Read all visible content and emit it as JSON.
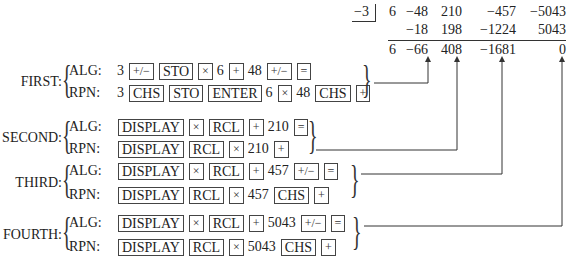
{
  "synthetic_division": {
    "divisor": "−3",
    "rows": [
      [
        "6",
        "−48",
        "210",
        "−457",
        "−5043"
      ],
      [
        "",
        "−18",
        "198",
        "−1224",
        "5043"
      ],
      [
        "6",
        "−66",
        "408",
        "−1681",
        "0"
      ]
    ]
  },
  "steps": [
    {
      "name": "FIRST:",
      "alg": {
        "label": "ALG:",
        "tokens": [
          {
            "t": "3",
            "k": false
          },
          {
            "t": "+/−",
            "k": true,
            "sm": true
          },
          {
            "t": "STO",
            "k": true
          },
          {
            "t": "×",
            "k": true,
            "sm": true
          },
          {
            "t": "6",
            "k": false
          },
          {
            "t": "+",
            "k": true,
            "sm": true
          },
          {
            "t": "48",
            "k": false
          },
          {
            "t": "+/−",
            "k": true,
            "sm": true
          },
          {
            "t": "=",
            "k": true,
            "sm": true
          }
        ]
      },
      "rpn": {
        "label": "RPN:",
        "tokens": [
          {
            "t": "3",
            "k": false
          },
          {
            "t": "CHS",
            "k": true
          },
          {
            "t": "STO",
            "k": true
          },
          {
            "t": "ENTER",
            "k": true
          },
          {
            "t": "6",
            "k": false
          },
          {
            "t": "×",
            "k": true,
            "sm": true
          },
          {
            "t": "48",
            "k": false
          },
          {
            "t": "CHS",
            "k": true
          },
          {
            "t": "+",
            "k": true,
            "sm": true
          }
        ]
      }
    },
    {
      "name": "SECOND:",
      "alg": {
        "label": "ALG:",
        "tokens": [
          {
            "t": "DISPLAY",
            "k": true
          },
          {
            "t": "×",
            "k": true,
            "sm": true
          },
          {
            "t": "RCL",
            "k": true
          },
          {
            "t": "+",
            "k": true,
            "sm": true
          },
          {
            "t": "210",
            "k": false
          },
          {
            "t": "=",
            "k": true,
            "sm": true
          }
        ]
      },
      "rpn": {
        "label": "RPN:",
        "tokens": [
          {
            "t": "DISPLAY",
            "k": true
          },
          {
            "t": "RCL",
            "k": true
          },
          {
            "t": "×",
            "k": true,
            "sm": true
          },
          {
            "t": "210",
            "k": false
          },
          {
            "t": "+",
            "k": true,
            "sm": true
          }
        ]
      }
    },
    {
      "name": "THIRD:",
      "alg": {
        "label": "ALG:",
        "tokens": [
          {
            "t": "DISPLAY",
            "k": true
          },
          {
            "t": "×",
            "k": true,
            "sm": true
          },
          {
            "t": "RCL",
            "k": true
          },
          {
            "t": "+",
            "k": true,
            "sm": true
          },
          {
            "t": "457",
            "k": false
          },
          {
            "t": "+/−",
            "k": true,
            "sm": true
          },
          {
            "t": "=",
            "k": true,
            "sm": true
          }
        ]
      },
      "rpn": {
        "label": "RPN:",
        "tokens": [
          {
            "t": "DISPLAY",
            "k": true
          },
          {
            "t": "RCL",
            "k": true
          },
          {
            "t": "×",
            "k": true,
            "sm": true
          },
          {
            "t": "457",
            "k": false
          },
          {
            "t": "CHS",
            "k": true
          },
          {
            "t": "+",
            "k": true,
            "sm": true
          }
        ]
      }
    },
    {
      "name": "FOURTH:",
      "alg": {
        "label": "ALG:",
        "tokens": [
          {
            "t": "DISPLAY",
            "k": true
          },
          {
            "t": "×",
            "k": true,
            "sm": true
          },
          {
            "t": "RCL",
            "k": true
          },
          {
            "t": "+",
            "k": true,
            "sm": true
          },
          {
            "t": "5043",
            "k": false
          },
          {
            "t": "+/−",
            "k": true,
            "sm": true
          },
          {
            "t": "=",
            "k": true,
            "sm": true
          }
        ]
      },
      "rpn": {
        "label": "RPN:",
        "tokens": [
          {
            "t": "DISPLAY",
            "k": true
          },
          {
            "t": "RCL",
            "k": true
          },
          {
            "t": "×",
            "k": true,
            "sm": true
          },
          {
            "t": "5043",
            "k": false
          },
          {
            "t": "CHS",
            "k": true
          },
          {
            "t": "+",
            "k": true,
            "sm": true
          }
        ]
      }
    }
  ]
}
